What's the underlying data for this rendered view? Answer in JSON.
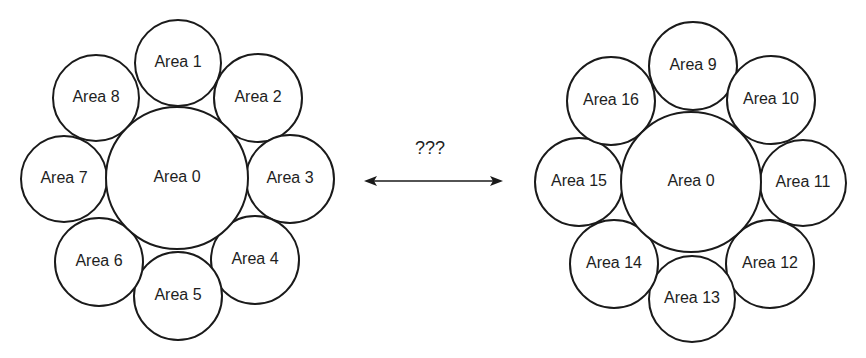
{
  "diagram": {
    "left_cluster": {
      "center": {
        "label": "Area 0",
        "cx": 177,
        "cy": 178,
        "r": 71
      },
      "areas": [
        {
          "label": "Area 1",
          "cx": 178,
          "cy": 63,
          "r": 43
        },
        {
          "label": "Area 2",
          "cx": 258,
          "cy": 98,
          "r": 44
        },
        {
          "label": "Area 3",
          "cx": 290,
          "cy": 179,
          "r": 44
        },
        {
          "label": "Area 4",
          "cx": 255,
          "cy": 260,
          "r": 44
        },
        {
          "label": "Area 5",
          "cx": 178,
          "cy": 296,
          "r": 44
        },
        {
          "label": "Area 6",
          "cx": 99,
          "cy": 262,
          "r": 44
        },
        {
          "label": "Area 7",
          "cx": 64,
          "cy": 179,
          "r": 43
        },
        {
          "label": "Area 8",
          "cx": 96,
          "cy": 98,
          "r": 43
        }
      ]
    },
    "right_cluster": {
      "center": {
        "label": "Area 0",
        "cx": 691,
        "cy": 182,
        "r": 70
      },
      "areas": [
        {
          "label": "Area 9",
          "cx": 693,
          "cy": 66,
          "r": 44
        },
        {
          "label": "Area 10",
          "cx": 771,
          "cy": 100,
          "r": 44
        },
        {
          "label": "Area 11",
          "cx": 803,
          "cy": 183,
          "r": 43
        },
        {
          "label": "Area 12",
          "cx": 770,
          "cy": 264,
          "r": 44
        },
        {
          "label": "Area 13",
          "cx": 692,
          "cy": 299,
          "r": 43
        },
        {
          "label": "Area 14",
          "cx": 614,
          "cy": 264,
          "r": 44
        },
        {
          "label": "Area 15",
          "cx": 579,
          "cy": 182,
          "r": 44
        },
        {
          "label": "Area 16",
          "cx": 611,
          "cy": 101,
          "r": 44
        }
      ]
    },
    "connection": {
      "label": "???",
      "x1": 364,
      "x2": 503,
      "y": 181,
      "bidirectional": true
    },
    "colors": {
      "stroke": "#1a1a1a",
      "text": "#1e1e1e",
      "background": "#ffffff"
    }
  }
}
